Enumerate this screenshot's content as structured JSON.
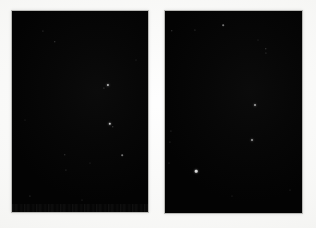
{
  "figure": {
    "title": "Two dark astronomical image plates",
    "description": "Side-by-side pair of near-black rectangular sky-survey image panels on a light paper background",
    "background_color": "#f8f8f7",
    "panel_fill_color": "#050505",
    "panel_border_color": "#b8b8b5",
    "star_color": "#ffffff",
    "canvas": {
      "width": 316,
      "height": 228
    }
  },
  "panels": [
    {
      "id": "panel-left",
      "label": "Left image panel",
      "x": 12,
      "y": 11,
      "width": 136,
      "height": 201,
      "bottom_band": {
        "top": 193,
        "height": 8
      },
      "stars": [
        {
          "x": 43,
          "y": 31,
          "r": 0.6,
          "brightness": 0.3
        },
        {
          "x": 55,
          "y": 42,
          "r": 0.7,
          "brightness": 0.38
        },
        {
          "x": 108,
          "y": 85,
          "r": 1.1,
          "brightness": 0.72
        },
        {
          "x": 104,
          "y": 88,
          "r": 0.6,
          "brightness": 0.34
        },
        {
          "x": 110,
          "y": 124,
          "r": 1.2,
          "brightness": 0.78
        },
        {
          "x": 113,
          "y": 127,
          "r": 0.7,
          "brightness": 0.4
        },
        {
          "x": 65,
          "y": 155,
          "r": 0.7,
          "brightness": 0.34
        },
        {
          "x": 66,
          "y": 170,
          "r": 0.6,
          "brightness": 0.28
        },
        {
          "x": 122,
          "y": 155,
          "r": 0.8,
          "brightness": 0.44
        },
        {
          "x": 90,
          "y": 163,
          "r": 0.5,
          "brightness": 0.22
        },
        {
          "x": 30,
          "y": 196,
          "r": 0.6,
          "brightness": 0.3
        },
        {
          "x": 82,
          "y": 200,
          "r": 0.5,
          "brightness": 0.24
        },
        {
          "x": 136,
          "y": 60,
          "r": 0.5,
          "brightness": 0.2
        },
        {
          "x": 25,
          "y": 120,
          "r": 0.5,
          "brightness": 0.18
        }
      ]
    },
    {
      "id": "panel-right",
      "label": "Right image panel",
      "x": 165,
      "y": 11,
      "width": 137,
      "height": 202,
      "bottom_band": null,
      "stars": [
        {
          "x": 172,
          "y": 31,
          "r": 0.7,
          "brightness": 0.36
        },
        {
          "x": 195,
          "y": 30,
          "r": 0.6,
          "brightness": 0.3
        },
        {
          "x": 223,
          "y": 25,
          "r": 0.8,
          "brightness": 0.44
        },
        {
          "x": 266,
          "y": 49,
          "r": 0.7,
          "brightness": 0.38
        },
        {
          "x": 266,
          "y": 53,
          "r": 0.6,
          "brightness": 0.3
        },
        {
          "x": 255,
          "y": 105,
          "r": 1.0,
          "brightness": 0.62
        },
        {
          "x": 252,
          "y": 140,
          "r": 1.0,
          "brightness": 0.6
        },
        {
          "x": 196,
          "y": 171,
          "r": 1.3,
          "brightness": 0.85
        },
        {
          "x": 171,
          "y": 131,
          "r": 0.6,
          "brightness": 0.26
        },
        {
          "x": 170,
          "y": 142,
          "r": 0.6,
          "brightness": 0.26
        },
        {
          "x": 169,
          "y": 163,
          "r": 0.5,
          "brightness": 0.22
        },
        {
          "x": 258,
          "y": 40,
          "r": 0.5,
          "brightness": 0.2
        },
        {
          "x": 290,
          "y": 190,
          "r": 0.5,
          "brightness": 0.22
        },
        {
          "x": 232,
          "y": 196,
          "r": 0.5,
          "brightness": 0.2
        }
      ]
    }
  ]
}
